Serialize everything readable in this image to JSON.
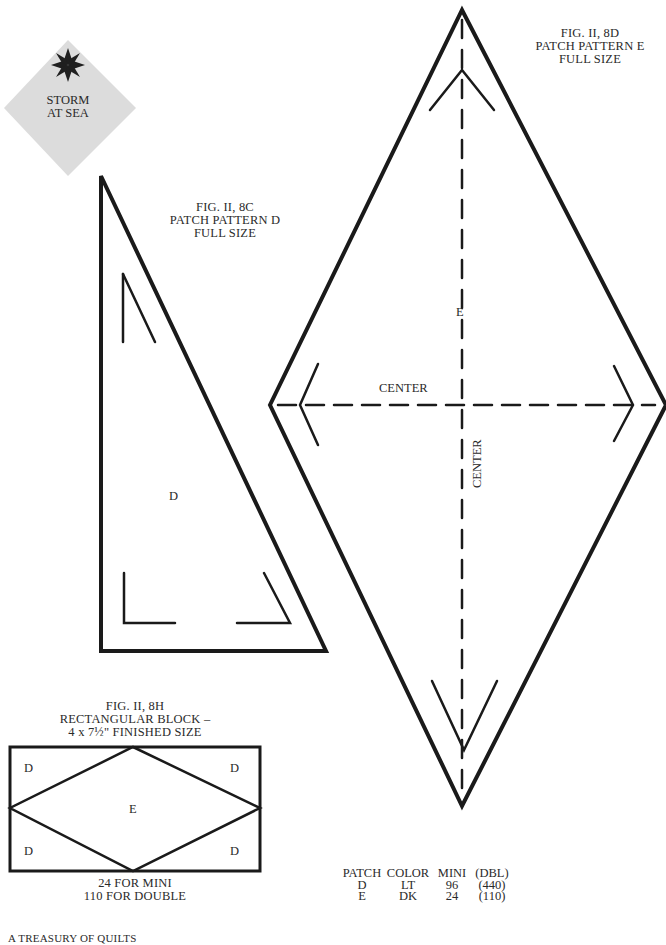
{
  "badge": {
    "icon": "eight-point-star-icon",
    "line1": "STORM",
    "line2": "AT SEA",
    "bg_color": "#dcdcdc",
    "icon_color": "#1f1f1f"
  },
  "figure_8c": {
    "caption_line1": "FIG. II, 8C",
    "caption_line2": "PATCH PATTERN D",
    "caption_line3": "FULL SIZE",
    "patch_label": "D"
  },
  "figure_8d": {
    "caption_line1": "FIG. II, 8D",
    "caption_line2": "PATCH PATTERN E",
    "caption_line3": "FULL SIZE",
    "patch_label": "E",
    "horizontal_axis_label": "CENTER",
    "vertical_axis_label": "CENTER"
  },
  "figure_8h": {
    "caption_line1": "FIG. II, 8H",
    "caption_line2": "RECTANGULAR BLOCK –",
    "caption_line3": "4 x 7½\" FINISHED SIZE",
    "labels": {
      "top_left": "D",
      "top_right": "D",
      "center": "E",
      "bottom_left": "D",
      "bottom_right": "D"
    },
    "note_line1": "24 FOR MINI",
    "note_line2": "110 FOR DOUBLE"
  },
  "patch_table": {
    "headers": [
      "PATCH",
      "COLOR",
      "MINI",
      "(DBL)"
    ],
    "rows": [
      [
        "D",
        "LT",
        "96",
        "(440)"
      ],
      [
        "E",
        "DK",
        "24",
        "(110)"
      ]
    ]
  },
  "footer": {
    "text": "A TREASURY OF QUILTS"
  },
  "colors": {
    "ink": "#1a1a1a",
    "text": "#2a2a2a",
    "paper": "#ffffff"
  }
}
